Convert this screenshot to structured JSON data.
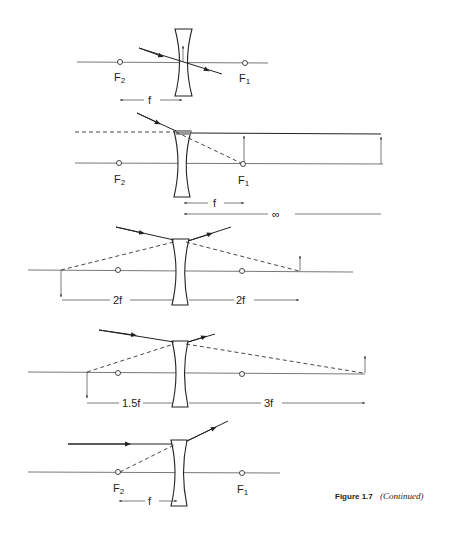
{
  "figure": {
    "caption_label": "Figure 1.7",
    "caption_note": "(Continued)"
  },
  "panels": [
    {
      "id": "panel-1",
      "description": "Ray through optical center passes undeviated",
      "focal_labels": {
        "left": "F",
        "left_sub": "2",
        "right": "F",
        "right_sub": "1"
      },
      "dimensions": [
        {
          "label": "f"
        }
      ]
    },
    {
      "id": "panel-2",
      "description": "Ray aimed at F1 emerges parallel; image at infinity",
      "focal_labels": {
        "left": "F",
        "left_sub": "2",
        "right": "F",
        "right_sub": "1"
      },
      "dimensions": [
        {
          "label": "f"
        },
        {
          "label": "∞"
        }
      ]
    },
    {
      "id": "panel-3",
      "description": "Object and virtual image at 2f",
      "dimensions": [
        {
          "label": "2f"
        },
        {
          "label": "2f"
        }
      ]
    },
    {
      "id": "panel-4",
      "description": "Object at 3f, virtual image at 1.5f",
      "dimensions": [
        {
          "label": "1.5f"
        },
        {
          "label": "3f"
        }
      ]
    },
    {
      "id": "panel-5",
      "description": "Parallel ray diverges as if from F2",
      "focal_labels": {
        "left": "F",
        "left_sub": "2",
        "right": "F",
        "right_sub": "1"
      },
      "dimensions": [
        {
          "label": "f"
        }
      ]
    }
  ]
}
